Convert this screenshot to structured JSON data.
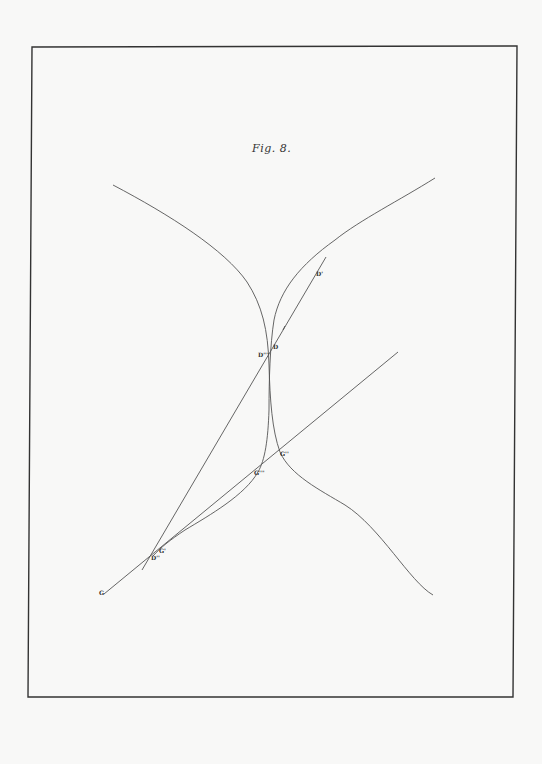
{
  "figure": {
    "title": "Fig. 8.",
    "labels": {
      "D": "D",
      "D1": "D'",
      "D2": "D''",
      "D3": "D'''",
      "G": "G",
      "G1": "G'",
      "G2": "G''",
      "G3": "G'''"
    },
    "colors": {
      "ink": "#555555",
      "frame": "#333333",
      "paper": "#f8f8f7"
    }
  }
}
